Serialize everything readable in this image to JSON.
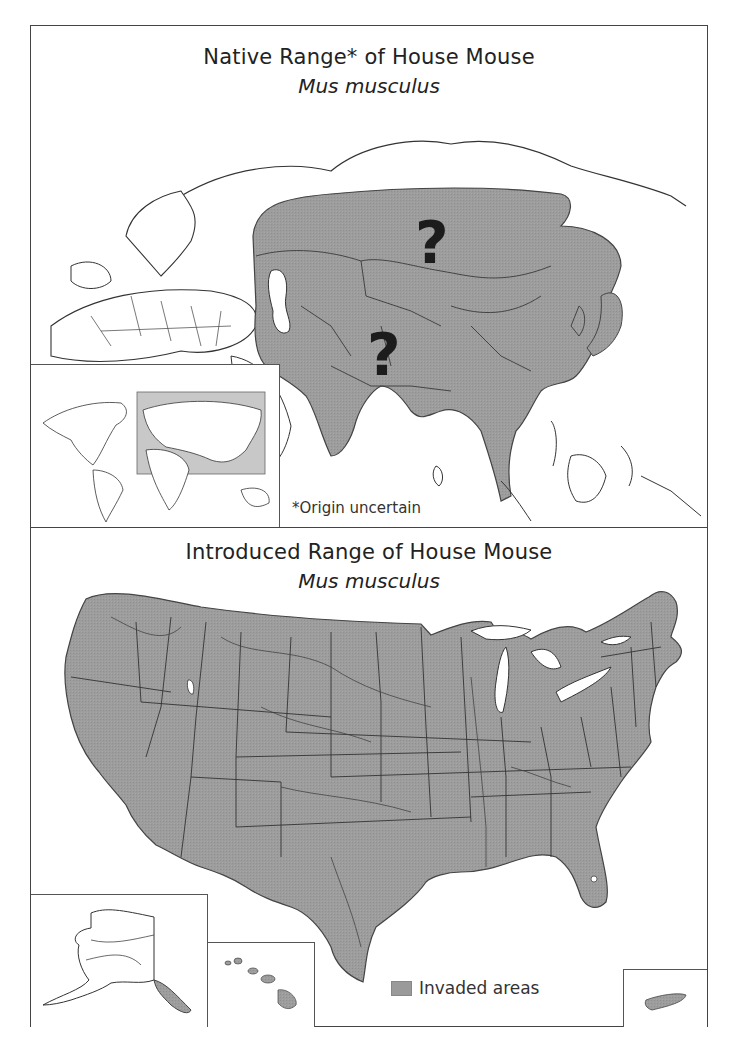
{
  "native_map": {
    "title": "Native Range* of House Mouse",
    "subtitle": "Mus musculus",
    "uncertainty_markers": [
      "?",
      "?"
    ],
    "footnote": "*Origin uncertain",
    "inset": "world-locator-map",
    "shading_color": "#9a9a9a"
  },
  "introduced_map": {
    "title": "Introduced Range of House Mouse",
    "subtitle": "Mus musculus",
    "insets": [
      "alaska",
      "hawaii",
      "puerto-rico"
    ],
    "legend": {
      "label": "Invaded areas",
      "color": "#9a9a9a"
    }
  },
  "colors": {
    "shading": "#9a9a9a",
    "outline": "#333333",
    "background": "#ffffff"
  }
}
